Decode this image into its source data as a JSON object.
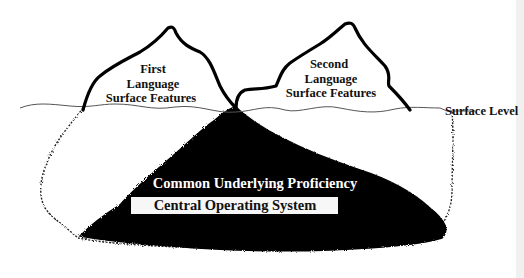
{
  "diagram": {
    "type": "iceberg",
    "peaks": [
      {
        "id": "first",
        "lines": [
          "First",
          "Language",
          "Surface Features"
        ]
      },
      {
        "id": "second",
        "lines": [
          "Second",
          "Language",
          "Surface Features"
        ]
      }
    ],
    "surface_label": "Surface Level",
    "underlying": {
      "title": "Common Underlying Proficiency",
      "subtitle": "Central Operating System"
    },
    "colors": {
      "background": "#ffffff",
      "outline": "#000000",
      "underwater_mass": "#050505",
      "waterline": "#555555",
      "subtitle_box": "#f7f7f7"
    }
  }
}
